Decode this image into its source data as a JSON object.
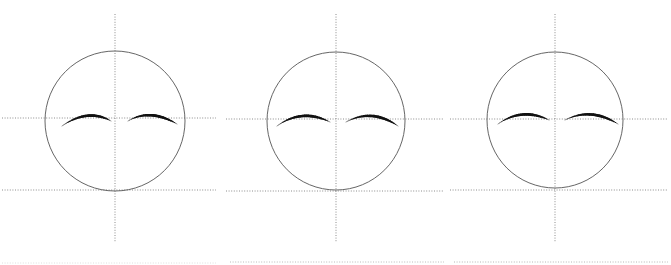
{
  "figure": {
    "type": "diagram",
    "canvas": {
      "width": 671,
      "height": 265,
      "background": "#ffffff"
    },
    "colors": {
      "circle_stroke": "#555555",
      "axis_stroke": "#808080",
      "eyebrow_stroke": "#111111",
      "background": "#ffffff",
      "footer_rule": "#9a9a9a"
    },
    "strokes": {
      "circle_width": 0.9,
      "axis_width": 0.9,
      "axis_dash": "1,1.6",
      "eyebrow_max_width": 3.2
    },
    "panels": [
      {
        "name": "panel-1",
        "label": "",
        "x_offset": 0,
        "width": 224,
        "circle": {
          "cx": 115,
          "cy": 121,
          "r": 70
        },
        "vertical_axis": {
          "x": 115,
          "y1": 14,
          "y2": 242,
          "dashed": true
        },
        "horizontal_axis": {
          "y": 118,
          "x1": 2,
          "x2": 216,
          "dashed": true
        },
        "baseline": {
          "y": 190,
          "x1": 2,
          "x2": 216,
          "dashed": true
        },
        "footer_rule": {
          "y": 263,
          "x1": 2,
          "x2": 216,
          "dashed": true,
          "opacity": 0.35
        },
        "left_eyebrow": {
          "x1": 62,
          "y1": 126,
          "cx": 88,
          "cy": 108,
          "x2": 111,
          "y2": 121
        },
        "right_eyebrow": {
          "x1": 128,
          "y1": 121,
          "cx": 150,
          "cy": 108,
          "x2": 177,
          "y2": 124
        }
      },
      {
        "name": "panel-2",
        "label": "",
        "x_offset": 224,
        "width": 224,
        "circle": {
          "cx": 112,
          "cy": 121,
          "r": 69
        },
        "vertical_axis": {
          "x": 112,
          "y1": 14,
          "y2": 242,
          "dashed": true
        },
        "horizontal_axis": {
          "y": 119,
          "x1": 2,
          "x2": 220,
          "dashed": true
        },
        "baseline": {
          "y": 191,
          "x1": 2,
          "x2": 220,
          "dashed": true
        },
        "footer_rule": {
          "y": 262,
          "x1": 6,
          "x2": 220,
          "dashed": true,
          "opacity": 0.75
        },
        "left_eyebrow": {
          "x1": 53,
          "y1": 126,
          "cx": 78,
          "cy": 108,
          "x2": 106,
          "y2": 122
        },
        "right_eyebrow": {
          "x1": 122,
          "y1": 122,
          "cx": 148,
          "cy": 108,
          "x2": 174,
          "y2": 126
        }
      },
      {
        "name": "panel-3",
        "label": "",
        "x_offset": 448,
        "width": 223,
        "circle": {
          "cx": 107,
          "cy": 120,
          "r": 68
        },
        "vertical_axis": {
          "x": 107,
          "y1": 14,
          "y2": 242,
          "dashed": true
        },
        "horizontal_axis": {
          "y": 119,
          "x1": 2,
          "x2": 220,
          "dashed": true
        },
        "baseline": {
          "y": 190,
          "x1": 2,
          "x2": 220,
          "dashed": true
        },
        "footer_rule": {
          "y": 262,
          "x1": 6,
          "x2": 220,
          "dashed": true,
          "opacity": 0.8
        },
        "left_eyebrow": {
          "x1": 50,
          "y1": 124,
          "cx": 74,
          "cy": 107,
          "x2": 101,
          "y2": 120
        },
        "right_eyebrow": {
          "x1": 117,
          "y1": 120,
          "cx": 143,
          "cy": 107,
          "x2": 170,
          "y2": 124
        }
      }
    ]
  }
}
